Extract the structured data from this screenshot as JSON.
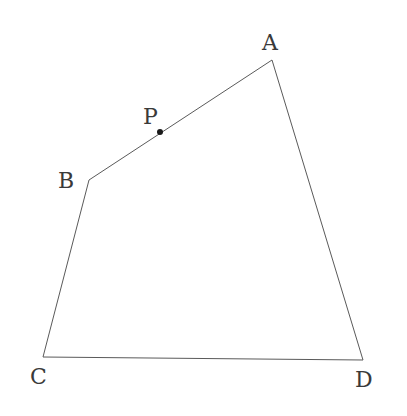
{
  "diagram": {
    "type": "quadrilateral",
    "vertices": [
      {
        "name": "A",
        "x": 272,
        "y": 60,
        "label_x": 262,
        "label_y": 50
      },
      {
        "name": "B",
        "x": 89,
        "y": 180,
        "label_x": 58,
        "label_y": 188
      },
      {
        "name": "C",
        "x": 43,
        "y": 357,
        "label_x": 30,
        "label_y": 384
      },
      {
        "name": "D",
        "x": 363,
        "y": 360,
        "label_x": 355,
        "label_y": 387
      }
    ],
    "edges": [
      [
        "A",
        "B"
      ],
      [
        "B",
        "C"
      ],
      [
        "C",
        "D"
      ],
      [
        "D",
        "A"
      ]
    ],
    "points": [
      {
        "name": "P",
        "on_edge": "AB",
        "x": 160,
        "y": 132,
        "label_x": 143,
        "label_y": 124
      }
    ],
    "labels": {
      "A": "A",
      "B": "B",
      "C": "C",
      "D": "D",
      "P": "P"
    }
  }
}
